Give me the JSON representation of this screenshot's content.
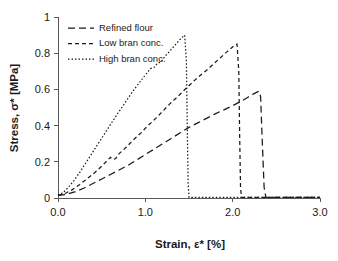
{
  "chart_data": {
    "type": "line",
    "title": "",
    "xlabel": "Strain, ε* [%]",
    "ylabel": "Stress, σ* [MPa]",
    "xlim": [
      0.0,
      3.0
    ],
    "ylim": [
      0,
      1
    ],
    "xticks": [
      "0.0",
      "1.0",
      "2.0",
      "3.0"
    ],
    "xtick_values": [
      0.0,
      1.0,
      2.0,
      3.0
    ],
    "yticks": [
      "0",
      "0.2",
      "0.4",
      "0.6",
      "0.8",
      "1"
    ],
    "ytick_values": [
      0,
      0.2,
      0.4,
      0.6,
      0.8,
      1
    ],
    "grid": false,
    "legend_position": "top-left",
    "series": [
      {
        "name": "Refined flour",
        "dash": "7,4",
        "color": "#1a1a1a",
        "peak": {
          "x": 2.3,
          "y": 0.59
        },
        "points": [
          [
            0.0,
            0.015
          ],
          [
            0.1,
            0.02
          ],
          [
            0.2,
            0.035
          ],
          [
            0.3,
            0.055
          ],
          [
            0.4,
            0.08
          ],
          [
            0.5,
            0.105
          ],
          [
            0.6,
            0.13
          ],
          [
            0.7,
            0.155
          ],
          [
            0.8,
            0.18
          ],
          [
            0.9,
            0.21
          ],
          [
            1.0,
            0.24
          ],
          [
            1.1,
            0.27
          ],
          [
            1.2,
            0.3
          ],
          [
            1.3,
            0.33
          ],
          [
            1.4,
            0.36
          ],
          [
            1.5,
            0.39
          ],
          [
            1.6,
            0.415
          ],
          [
            1.7,
            0.44
          ],
          [
            1.8,
            0.465
          ],
          [
            1.9,
            0.487
          ],
          [
            2.0,
            0.51
          ],
          [
            2.1,
            0.535
          ],
          [
            2.18,
            0.558
          ],
          [
            2.25,
            0.578
          ],
          [
            2.3,
            0.59
          ],
          [
            2.32,
            0.56
          ],
          [
            2.34,
            0.3
          ],
          [
            2.36,
            0.06
          ],
          [
            2.38,
            0.005
          ],
          [
            2.45,
            0.003
          ],
          [
            2.7,
            0.003
          ],
          [
            3.0,
            0.003
          ]
        ]
      },
      {
        "name": "Low bran conc.",
        "dash": "4,3",
        "color": "#1a1a1a",
        "peak": {
          "x": 2.05,
          "y": 0.85
        },
        "points": [
          [
            0.0,
            0.015
          ],
          [
            0.08,
            0.025
          ],
          [
            0.16,
            0.045
          ],
          [
            0.25,
            0.075
          ],
          [
            0.33,
            0.105
          ],
          [
            0.42,
            0.14
          ],
          [
            0.5,
            0.175
          ],
          [
            0.57,
            0.21
          ],
          [
            0.6,
            0.225
          ],
          [
            0.63,
            0.212
          ],
          [
            0.66,
            0.218
          ],
          [
            0.7,
            0.245
          ],
          [
            0.78,
            0.28
          ],
          [
            0.86,
            0.32
          ],
          [
            0.95,
            0.36
          ],
          [
            1.03,
            0.4
          ],
          [
            1.12,
            0.44
          ],
          [
            1.2,
            0.48
          ],
          [
            1.28,
            0.52
          ],
          [
            1.36,
            0.555
          ],
          [
            1.45,
            0.598
          ],
          [
            1.53,
            0.635
          ],
          [
            1.61,
            0.67
          ],
          [
            1.7,
            0.705
          ],
          [
            1.78,
            0.74
          ],
          [
            1.86,
            0.775
          ],
          [
            1.94,
            0.81
          ],
          [
            2.02,
            0.843
          ],
          [
            2.05,
            0.85
          ],
          [
            2.07,
            0.7
          ],
          [
            2.08,
            0.35
          ],
          [
            2.09,
            0.06
          ],
          [
            2.1,
            0.004
          ],
          [
            2.2,
            0.003
          ],
          [
            2.6,
            0.003
          ],
          [
            3.0,
            0.003
          ]
        ]
      },
      {
        "name": "High bran conc.",
        "dash": "1.5,2",
        "color": "#6e6e6e",
        "peak": {
          "x": 1.45,
          "y": 0.9
        },
        "points": [
          [
            0.0,
            0.015
          ],
          [
            0.06,
            0.03
          ],
          [
            0.12,
            0.06
          ],
          [
            0.18,
            0.095
          ],
          [
            0.24,
            0.135
          ],
          [
            0.3,
            0.18
          ],
          [
            0.36,
            0.225
          ],
          [
            0.42,
            0.27
          ],
          [
            0.48,
            0.315
          ],
          [
            0.54,
            0.36
          ],
          [
            0.6,
            0.405
          ],
          [
            0.66,
            0.45
          ],
          [
            0.72,
            0.492
          ],
          [
            0.78,
            0.535
          ],
          [
            0.84,
            0.578
          ],
          [
            0.9,
            0.618
          ],
          [
            0.96,
            0.655
          ],
          [
            1.02,
            0.692
          ],
          [
            1.06,
            0.715
          ],
          [
            1.1,
            0.722
          ],
          [
            1.14,
            0.745
          ],
          [
            1.18,
            0.752
          ],
          [
            1.22,
            0.78
          ],
          [
            1.28,
            0.812
          ],
          [
            1.34,
            0.845
          ],
          [
            1.4,
            0.878
          ],
          [
            1.45,
            0.9
          ],
          [
            1.47,
            0.76
          ],
          [
            1.48,
            0.4
          ],
          [
            1.49,
            0.08
          ],
          [
            1.5,
            0.004
          ],
          [
            1.6,
            0.003
          ],
          [
            2.0,
            0.003
          ],
          [
            2.5,
            0.003
          ],
          [
            3.0,
            0.003
          ]
        ]
      }
    ],
    "legend": [
      {
        "label": "Refined flour",
        "dash": "7,4",
        "color": "#1a1a1a"
      },
      {
        "label": "Low bran conc.",
        "dash": "4,3",
        "color": "#1a1a1a"
      },
      {
        "label": "High bran conc.",
        "dash": "1.5,2",
        "color": "#6e6e6e"
      }
    ]
  }
}
